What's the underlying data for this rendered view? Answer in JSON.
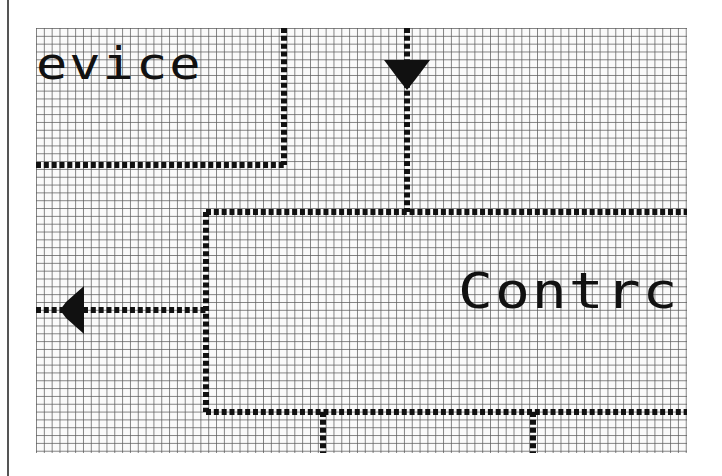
{
  "diagram": {
    "blocks": [
      {
        "id": "device",
        "label_visible": "evice",
        "partial": true
      },
      {
        "id": "controller",
        "label_visible": "Contrc",
        "partial": true
      }
    ],
    "connectors": [
      {
        "from": "top",
        "to": "controller",
        "arrow": "down"
      },
      {
        "from": "controller",
        "to": "left",
        "arrow": "left"
      },
      {
        "from": "controller",
        "to": "bottom",
        "arrow": "none",
        "count": 2
      }
    ],
    "colors": {
      "ink": "#111111",
      "grid": "#5a5a5a",
      "background": "#fafafa"
    }
  }
}
